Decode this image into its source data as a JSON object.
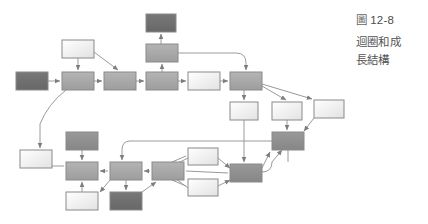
{
  "caption": {
    "figure_label": "圖",
    "figure_number": "12-8",
    "title_line": "圖 12-8",
    "description": "迴圈和成長結構",
    "description_line_1": "迴圈和成",
    "description_line_2": "長結構"
  },
  "colors": {
    "node_dark": "#6f6f6f",
    "node_mid": "#a8a8a8",
    "node_light": "#ededed",
    "node_white": "#fafafa",
    "stroke": "#8a8a8a",
    "edge": "#9a9a9a",
    "text": "#555555",
    "background": "#ffffff"
  },
  "diagram": {
    "type": "node-link-flow-graph",
    "width": 428,
    "height": 224,
    "node_count": 25,
    "edge_count": 34,
    "nodes": [
      {
        "id": "n1",
        "name": "node-start-left",
        "x": 16,
        "y": 72,
        "w": 32,
        "h": 18,
        "fill": "#6f6f6f"
      },
      {
        "id": "n2",
        "name": "node-upper-light-top",
        "x": 62,
        "y": 40,
        "w": 32,
        "h": 18,
        "fill": "#f2f2f2"
      },
      {
        "id": "n3",
        "name": "node-row1-second",
        "x": 62,
        "y": 72,
        "w": 32,
        "h": 18,
        "fill": "#a8a8a8"
      },
      {
        "id": "n4",
        "name": "node-row1-third",
        "x": 104,
        "y": 72,
        "w": 32,
        "h": 18,
        "fill": "#a8a8a8"
      },
      {
        "id": "n5",
        "name": "node-top-dark",
        "x": 146,
        "y": 14,
        "w": 30,
        "h": 18,
        "fill": "#6f6f6f"
      },
      {
        "id": "n6",
        "name": "node-upper-mid",
        "x": 146,
        "y": 44,
        "w": 32,
        "h": 18,
        "fill": "#a8a8a8"
      },
      {
        "id": "n7",
        "name": "node-row1-fourth",
        "x": 146,
        "y": 72,
        "w": 32,
        "h": 18,
        "fill": "#a8a8a8"
      },
      {
        "id": "n8",
        "name": "node-row1-light",
        "x": 188,
        "y": 72,
        "w": 32,
        "h": 18,
        "fill": "#f2f2f2"
      },
      {
        "id": "n9",
        "name": "node-hub-right",
        "x": 230,
        "y": 72,
        "w": 32,
        "h": 18,
        "fill": "#a8a8a8"
      },
      {
        "id": "n10",
        "name": "node-below-hub-light",
        "x": 230,
        "y": 102,
        "w": 28,
        "h": 18,
        "fill": "#f2f2f2"
      },
      {
        "id": "n11",
        "name": "node-right-light-a",
        "x": 272,
        "y": 102,
        "w": 30,
        "h": 18,
        "fill": "#f2f2f2"
      },
      {
        "id": "n12",
        "name": "node-far-right-light",
        "x": 314,
        "y": 100,
        "w": 30,
        "h": 18,
        "fill": "#fafafa"
      },
      {
        "id": "n13",
        "name": "node-right-mid",
        "x": 272,
        "y": 132,
        "w": 32,
        "h": 18,
        "fill": "#8f8f8f"
      },
      {
        "id": "n14",
        "name": "node-bottom-left-white",
        "x": 20,
        "y": 150,
        "w": 32,
        "h": 18,
        "fill": "#fafafa"
      },
      {
        "id": "n15",
        "name": "node-bottom-dark-upper",
        "x": 66,
        "y": 132,
        "w": 32,
        "h": 18,
        "fill": "#8f8f8f"
      },
      {
        "id": "n16",
        "name": "node-bottom-row-second",
        "x": 66,
        "y": 162,
        "w": 32,
        "h": 18,
        "fill": "#a8a8a8"
      },
      {
        "id": "n17",
        "name": "node-bottom-light-lower",
        "x": 66,
        "y": 192,
        "w": 32,
        "h": 18,
        "fill": "#fafafa"
      },
      {
        "id": "n18",
        "name": "node-bottom-center",
        "x": 110,
        "y": 162,
        "w": 32,
        "h": 18,
        "fill": "#a8a8a8"
      },
      {
        "id": "n19",
        "name": "node-bottom-dark-lower",
        "x": 110,
        "y": 192,
        "w": 32,
        "h": 18,
        "fill": "#6f6f6f"
      },
      {
        "id": "n20",
        "name": "node-bottom-right-of-center",
        "x": 152,
        "y": 162,
        "w": 32,
        "h": 18,
        "fill": "#a8a8a8"
      },
      {
        "id": "n21",
        "name": "node-bottom-light-upper-r",
        "x": 188,
        "y": 150,
        "w": 30,
        "h": 16,
        "fill": "#f2f2f2"
      },
      {
        "id": "n22",
        "name": "node-bottom-light-lower-r",
        "x": 188,
        "y": 180,
        "w": 30,
        "h": 16,
        "fill": "#f2f2f2"
      },
      {
        "id": "n23",
        "name": "node-bottom-hub",
        "x": 230,
        "y": 164,
        "w": 32,
        "h": 18,
        "fill": "#8f8f8f"
      },
      {
        "id": "n24",
        "name": "node-upper-right-tall",
        "x": 272,
        "y": 72,
        "w": 0,
        "h": 0,
        "fill": "#ffffff"
      },
      {
        "id": "n25",
        "name": "node-spacer",
        "x": 0,
        "y": 0,
        "w": 0,
        "h": 0,
        "fill": "#ffffff"
      }
    ],
    "edges": [
      {
        "from": "n1",
        "to": "n3",
        "kind": "straight"
      },
      {
        "from": "n2",
        "to": "n3",
        "kind": "straight"
      },
      {
        "from": "n2",
        "to": "n4",
        "kind": "diagonal"
      },
      {
        "from": "n3",
        "to": "n4",
        "kind": "straight"
      },
      {
        "from": "n4",
        "to": "n7",
        "kind": "straight"
      },
      {
        "from": "n6",
        "to": "n5",
        "kind": "straight"
      },
      {
        "from": "n7",
        "to": "n6",
        "kind": "straight"
      },
      {
        "from": "n6",
        "to": "n9",
        "kind": "orthogonal"
      },
      {
        "from": "n7",
        "to": "n8",
        "kind": "straight"
      },
      {
        "from": "n8",
        "to": "n9",
        "kind": "straight"
      },
      {
        "from": "n9",
        "to": "n10",
        "kind": "straight"
      },
      {
        "from": "n9",
        "to": "n11",
        "kind": "diagonal"
      },
      {
        "from": "n9",
        "to": "n12",
        "kind": "diagonal"
      },
      {
        "from": "n11",
        "to": "n13",
        "kind": "straight"
      },
      {
        "from": "n12",
        "to": "n13",
        "kind": "diagonal"
      },
      {
        "from": "n10",
        "to": "n23",
        "kind": "straight"
      },
      {
        "from": "n3",
        "to": "n14",
        "kind": "curved"
      },
      {
        "from": "n14",
        "to": "n16",
        "kind": "straight"
      },
      {
        "from": "n15",
        "to": "n16",
        "kind": "straight"
      },
      {
        "from": "n17",
        "to": "n16",
        "kind": "straight"
      },
      {
        "from": "n18",
        "to": "n16",
        "kind": "straight"
      },
      {
        "from": "n18",
        "to": "n17",
        "kind": "diagonal"
      },
      {
        "from": "n18",
        "to": "n19",
        "kind": "straight"
      },
      {
        "from": "n20",
        "to": "n18",
        "kind": "straight"
      },
      {
        "from": "n19",
        "to": "n20",
        "kind": "diagonal"
      },
      {
        "from": "n13",
        "to": "n18",
        "kind": "orthogonal"
      },
      {
        "from": "n20",
        "to": "n21",
        "kind": "diagonal"
      },
      {
        "from": "n20",
        "to": "n22",
        "kind": "diagonal"
      },
      {
        "from": "n21",
        "to": "n23",
        "kind": "diagonal"
      },
      {
        "from": "n22",
        "to": "n23",
        "kind": "diagonal"
      },
      {
        "from": "n23",
        "to": "n13",
        "kind": "straight"
      },
      {
        "from": "n23",
        "to": "n20",
        "kind": "straight"
      },
      {
        "from": "n13",
        "to": "n23",
        "kind": "orthogonal"
      },
      {
        "from": "n23",
        "to": "n12",
        "kind": "diagonal"
      }
    ]
  }
}
